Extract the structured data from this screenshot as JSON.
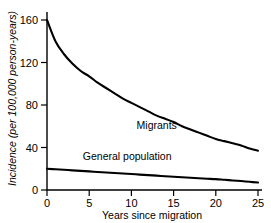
{
  "chart_data": {
    "type": "line",
    "title": "",
    "subtitle": "",
    "xlabel": "Years since migration",
    "ylabel": "Incidence (per 100,000 person-years)",
    "xlim": [
      0,
      25
    ],
    "ylim": [
      0,
      170
    ],
    "xticks": [
      0,
      5,
      10,
      15,
      20,
      25
    ],
    "xtick_labels": [
      "0",
      "5",
      "10",
      "15",
      "20",
      "25"
    ],
    "yticks": [
      0,
      40,
      80,
      120,
      160
    ],
    "ytick_labels": [
      "0",
      "40",
      "80",
      "120",
      "160"
    ],
    "grid": false,
    "legend_position": "inline-annotations",
    "line_color": "#000000",
    "background_color": "#ffffff",
    "x": [
      0,
      1,
      2,
      3,
      4,
      5,
      6,
      7,
      8,
      9,
      10,
      11,
      12,
      13,
      14,
      15,
      16,
      17,
      18,
      19,
      20,
      21,
      22,
      23,
      24,
      25
    ],
    "series": [
      {
        "name": "Migrants",
        "label_x": 13.0,
        "label_y": 57,
        "values": [
          160,
          140,
          128,
          119,
          112,
          107,
          101,
          96,
          91,
          86,
          82,
          78,
          74,
          70,
          67,
          64,
          60,
          57,
          54,
          51,
          48,
          46,
          44,
          42,
          39,
          37
        ]
      },
      {
        "name": "General population",
        "label_x": 9.5,
        "label_y": 28,
        "values": [
          20,
          19.5,
          19,
          18.5,
          18,
          17.5,
          17,
          16.5,
          16,
          15.5,
          15,
          14.5,
          14,
          13.5,
          13,
          12.5,
          12,
          11.5,
          11,
          10.6,
          10.2,
          9.6,
          9.0,
          8.4,
          7.7,
          7.0
        ]
      }
    ]
  }
}
